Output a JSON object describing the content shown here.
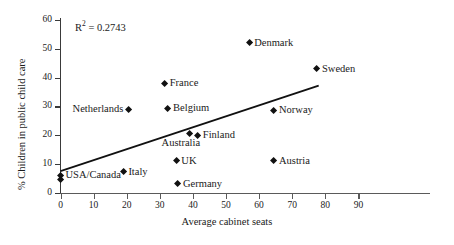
{
  "chart_data": {
    "type": "scatter",
    "title": "",
    "xlabel": "Average cabinet seats",
    "ylabel": "% Children in public child care",
    "xlim": [
      0,
      95
    ],
    "ylim": [
      0,
      63
    ],
    "xticks": [
      0,
      10,
      20,
      30,
      40,
      50,
      60,
      70,
      80,
      90
    ],
    "yticks": [
      0,
      10,
      20,
      30,
      40,
      50,
      60
    ],
    "grid": false,
    "legend": null,
    "annotations": [
      {
        "name": "r-squared",
        "text": "R2 = 0.2743",
        "value": 0.2743
      }
    ],
    "points": [
      {
        "label": "Denmark",
        "x": 57.0,
        "y": 52.0,
        "label_pos": "right"
      },
      {
        "label": "Sweden",
        "x": 77.5,
        "y": 43.0,
        "label_pos": "right"
      },
      {
        "label": "France",
        "x": 31.5,
        "y": 38.0,
        "label_pos": "right"
      },
      {
        "label": "Netherlands",
        "x": 20.5,
        "y": 29.0,
        "label_pos": "left"
      },
      {
        "label": "Belgium",
        "x": 32.5,
        "y": 29.3,
        "label_pos": "right"
      },
      {
        "label": "Norway",
        "x": 64.5,
        "y": 28.7,
        "label_pos": "right"
      },
      {
        "label": "Australia",
        "x": 39.0,
        "y": 20.6,
        "label_pos": "below"
      },
      {
        "label": "Finland",
        "x": 41.5,
        "y": 20.0,
        "label_pos": "right"
      },
      {
        "label": "UK",
        "x": 35.0,
        "y": 11.2,
        "label_pos": "right"
      },
      {
        "label": "Austria",
        "x": 64.5,
        "y": 11.2,
        "label_pos": "right"
      },
      {
        "label": "Italy",
        "x": 19.0,
        "y": 7.4,
        "label_pos": "right"
      },
      {
        "label": "USA/Canada",
        "x": 0.0,
        "y": 6.2,
        "label_pos": "right"
      },
      {
        "label": "",
        "x": 0.0,
        "y": 4.6,
        "label_pos": "right"
      },
      {
        "label": "Germany",
        "x": 35.5,
        "y": 3.2,
        "label_pos": "right"
      }
    ],
    "trendline": {
      "x0": 0.0,
      "y0": 7.6,
      "x1": 78.0,
      "y1": 37.2
    }
  },
  "labels": {
    "r_squared_prefix": "R",
    "r_squared_exp": "2",
    "r_squared_value": " = 0.2743"
  }
}
